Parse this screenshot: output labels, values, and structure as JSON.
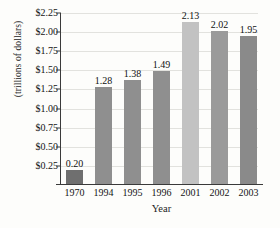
{
  "chart_data": {
    "type": "bar",
    "title": "",
    "xlabel": "Year",
    "ylabel": "(trillions of dollars)",
    "categories": [
      "1970",
      "1994",
      "1995",
      "1996",
      "2001",
      "2002",
      "2003"
    ],
    "values": [
      0.2,
      1.28,
      1.38,
      1.49,
      2.13,
      2.02,
      1.95
    ],
    "data_labels": [
      "0.20",
      "1.28",
      "1.38",
      "1.49",
      "2.13",
      "2.02",
      "1.95"
    ],
    "bar_colors": [
      "#6f6f6f",
      "#8f8f8f",
      "#8f8f8f",
      "#8f8f8f",
      "#c2c2c2",
      "#9a9a9a",
      "#8a8a8a"
    ],
    "ylim": [
      0,
      2.25
    ],
    "ytick_values": [
      2.25,
      2.0,
      1.75,
      1.5,
      1.25,
      1.0,
      0.75,
      0.5,
      0.25
    ],
    "ytick_labels": [
      "$2.25",
      "$2.00",
      "$1.75",
      "$1.50",
      "$1.25",
      "$1.00",
      "$0.75",
      "$0.50",
      "$0.25"
    ],
    "grid": true,
    "grid_color": "#e2e2de",
    "legend": "none",
    "axis_color": "#3a3a3a",
    "background": "#fdfdfb"
  }
}
